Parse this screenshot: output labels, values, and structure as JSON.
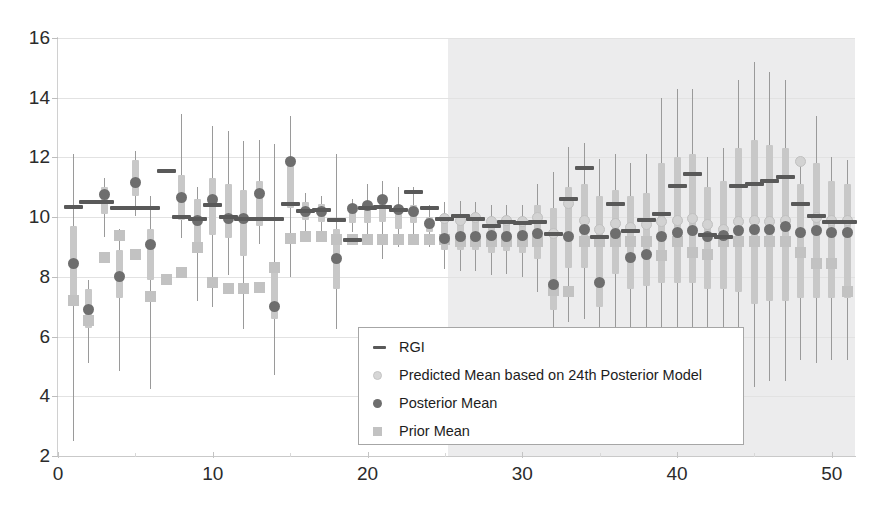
{
  "chart_data": {
    "type": "scatter",
    "title": "",
    "xlabel": "",
    "ylabel": "",
    "xlim": [
      0,
      51.5
    ],
    "ylim": [
      2,
      16
    ],
    "x_ticks": [
      0,
      10,
      20,
      30,
      40,
      50
    ],
    "y_ticks": [
      2,
      4,
      6,
      8,
      10,
      12,
      14,
      16
    ],
    "grid": true,
    "legend_position": "center-bottom",
    "shaded_region": {
      "x_start": 25.2,
      "x_end": 51.5,
      "color": "#ececed",
      "label": "forecast region"
    },
    "legend": [
      {
        "key": "rgi",
        "label": "RGI",
        "marker": "dash",
        "color": "#595959"
      },
      {
        "key": "predicted_mean",
        "label": "Predicted Mean based on 24th Posterior Model",
        "marker": "circle-light",
        "color": "#d2d2d2"
      },
      {
        "key": "posterior_mean",
        "label": "Posterior Mean",
        "marker": "circle-dark",
        "color": "#6e6e6e"
      },
      {
        "key": "prior_mean",
        "label": "Prior Mean",
        "marker": "square",
        "color": "#c2c2c2"
      }
    ],
    "series_colors": {
      "rgi": "#595959",
      "predicted_mean": "#d2d2d2",
      "posterior_mean": "#6e6e6e",
      "prior_mean": "#c2c2c2",
      "whisker": "#9a9a9a",
      "box": "#c8c8c8"
    },
    "x": [
      1,
      2,
      3,
      4,
      5,
      6,
      7,
      8,
      9,
      10,
      11,
      12,
      13,
      14,
      15,
      16,
      17,
      18,
      19,
      20,
      21,
      22,
      23,
      24,
      25,
      26,
      27,
      28,
      29,
      30,
      31,
      32,
      33,
      34,
      35,
      36,
      37,
      38,
      39,
      40,
      41,
      42,
      43,
      44,
      45,
      46,
      47,
      48,
      49,
      50,
      51
    ],
    "series": [
      {
        "name": "RGI",
        "values": [
          10.35,
          10.5,
          10.5,
          10.3,
          10.3,
          10.3,
          11.55,
          10.0,
          9.95,
          10.4,
          10.0,
          9.95,
          9.95,
          9.95,
          10.45,
          10.2,
          10.25,
          9.9,
          9.25,
          10.3,
          10.35,
          10.25,
          10.85,
          10.3,
          9.95,
          10.05,
          9.95,
          9.7,
          9.85,
          9.8,
          9.85,
          9.45,
          10.6,
          11.65,
          9.35,
          10.45,
          9.55,
          9.9,
          10.1,
          11.05,
          11.45,
          9.4,
          9.35,
          11.05,
          11.1,
          11.2,
          11.35,
          10.45,
          10.05,
          9.85,
          9.85
        ]
      },
      {
        "name": "Posterior Mean",
        "values": [
          8.45,
          6.9,
          10.75,
          8.0,
          11.15,
          9.1,
          null,
          10.65,
          9.9,
          10.6,
          9.95,
          9.95,
          10.8,
          7.0,
          11.85,
          10.2,
          10.2,
          8.6,
          10.3,
          10.4,
          10.6,
          10.25,
          10.2,
          9.8,
          9.3,
          9.35,
          9.35,
          9.4,
          9.35,
          9.4,
          9.45,
          7.75,
          9.35,
          9.6,
          7.8,
          9.45,
          8.65,
          8.75,
          9.35,
          9.5,
          9.55,
          9.35,
          9.4,
          9.55,
          9.6,
          9.6,
          9.7,
          9.5,
          9.55,
          9.5,
          9.5
        ]
      },
      {
        "name": "Predicted Mean based on 24th Posterior Model",
        "values": [
          null,
          null,
          null,
          null,
          null,
          null,
          null,
          null,
          null,
          null,
          null,
          null,
          null,
          null,
          null,
          null,
          null,
          null,
          null,
          null,
          null,
          null,
          null,
          null,
          9.95,
          9.9,
          10.0,
          9.85,
          9.9,
          9.85,
          10.0,
          9.45,
          10.45,
          9.9,
          9.6,
          9.8,
          9.65,
          9.75,
          9.85,
          9.9,
          9.95,
          9.75,
          9.6,
          9.85,
          9.9,
          9.85,
          9.9,
          11.85,
          10.0,
          9.9,
          9.9
        ]
      },
      {
        "name": "Prior Mean",
        "values": [
          7.2,
          6.55,
          8.65,
          9.4,
          8.75,
          7.35,
          7.9,
          8.15,
          9.0,
          7.8,
          7.6,
          7.6,
          7.65,
          8.3,
          9.3,
          9.35,
          9.35,
          9.25,
          9.25,
          9.25,
          9.25,
          9.25,
          9.25,
          9.25,
          9.25,
          9.2,
          9.2,
          9.2,
          9.2,
          9.2,
          9.2,
          7.55,
          7.5,
          9.2,
          9.2,
          9.2,
          9.2,
          9.2,
          8.7,
          9.2,
          8.8,
          8.75,
          9.2,
          9.2,
          9.2,
          9.2,
          9.2,
          8.8,
          8.45,
          8.45,
          7.5
        ]
      },
      {
        "name": "Whisker Low",
        "values": [
          2.5,
          5.1,
          9.35,
          4.85,
          10.05,
          4.25,
          null,
          9.3,
          7.2,
          7.0,
          8.05,
          6.25,
          9.1,
          4.7,
          8.0,
          9.5,
          9.5,
          6.25,
          9.5,
          9.2,
          8.6,
          9.0,
          9.35,
          9.0,
          8.25,
          8.2,
          8.2,
          8.05,
          8.1,
          8.0,
          7.5,
          5.0,
          6.5,
          6.6,
          5.0,
          6.2,
          5.6,
          5.8,
          5.6,
          5.6,
          5.6,
          5.5,
          5.5,
          5.4,
          4.3,
          4.5,
          4.5,
          5.2,
          5.1,
          5.2,
          5.2
        ]
      },
      {
        "name": "Whisker High",
        "values": [
          12.1,
          7.9,
          11.3,
          9.6,
          12.2,
          10.7,
          null,
          13.45,
          11.0,
          13.05,
          12.9,
          12.55,
          12.6,
          12.45,
          13.4,
          10.8,
          10.7,
          12.1,
          10.6,
          11.1,
          11.2,
          11.0,
          11.0,
          10.4,
          10.5,
          10.55,
          10.5,
          10.4,
          10.4,
          10.4,
          11.1,
          11.5,
          12.35,
          12.5,
          11.95,
          12.1,
          11.8,
          12.1,
          14.0,
          14.3,
          14.3,
          12.0,
          12.3,
          14.6,
          15.2,
          14.85,
          14.6,
          12.0,
          13.4,
          12.0,
          11.9
        ]
      },
      {
        "name": "Box Low",
        "values": [
          7.1,
          6.3,
          10.1,
          7.3,
          10.7,
          7.9,
          null,
          9.9,
          9.1,
          9.4,
          9.3,
          8.7,
          9.7,
          6.6,
          10.3,
          9.9,
          9.85,
          7.6,
          9.8,
          9.8,
          9.85,
          9.6,
          9.8,
          9.5,
          8.9,
          8.9,
          8.9,
          8.8,
          8.85,
          8.8,
          8.6,
          6.9,
          8.3,
          8.3,
          7.0,
          8.1,
          7.6,
          7.7,
          7.8,
          7.8,
          7.8,
          7.6,
          7.6,
          7.5,
          7.1,
          7.2,
          7.2,
          7.3,
          7.3,
          7.3,
          7.3
        ]
      },
      {
        "name": "Box High",
        "values": [
          9.7,
          7.6,
          11.0,
          8.9,
          11.9,
          9.6,
          null,
          11.4,
          10.6,
          11.3,
          11.1,
          10.9,
          11.2,
          8.4,
          12.0,
          10.5,
          10.45,
          9.6,
          10.2,
          10.5,
          10.6,
          10.4,
          10.4,
          10.0,
          10.1,
          10.1,
          10.1,
          10.0,
          10.0,
          10.0,
          10.4,
          10.3,
          11.0,
          11.1,
          10.7,
          10.9,
          10.7,
          10.8,
          11.8,
          12.0,
          12.1,
          11.0,
          11.2,
          12.3,
          12.6,
          12.4,
          12.3,
          11.1,
          11.8,
          11.2,
          11.1
        ]
      }
    ]
  }
}
